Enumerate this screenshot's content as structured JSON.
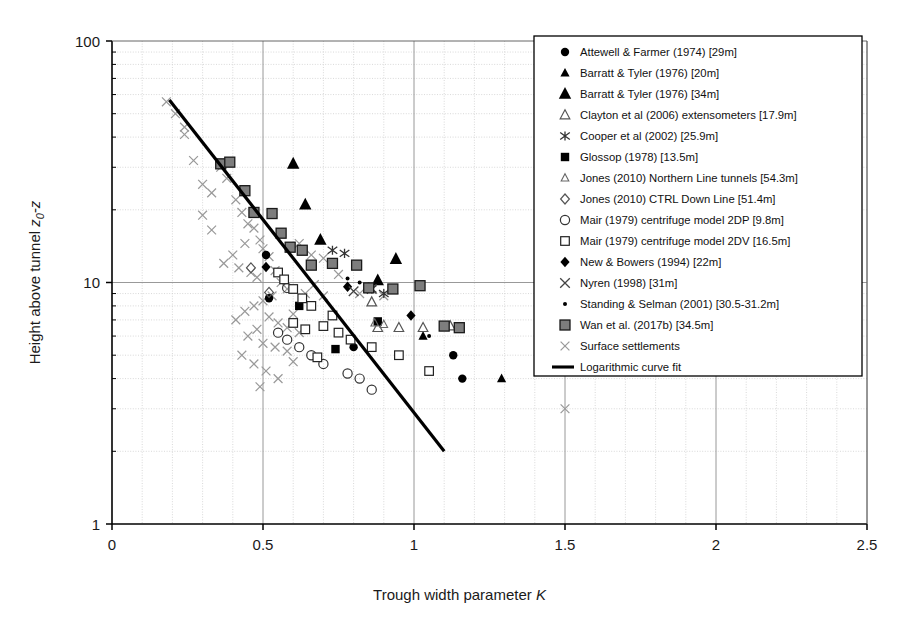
{
  "chart_data": {
    "type": "scatter",
    "title": "",
    "xlabel": "Trough width parameter K",
    "ylabel": "Height above tunnel z0-z",
    "ylabel_parts": {
      "main": "Height above tunnel ",
      "z": "z",
      "sub": "0",
      "tail": "-z"
    },
    "xlabel_parts": {
      "main": "Trough  width  parameter ",
      "italic": "K"
    },
    "xlim": [
      0,
      2.5
    ],
    "ylim": [
      1,
      100
    ],
    "yscale": "log",
    "xscale": "linear",
    "grid": true,
    "minor_grid": true,
    "xticks": [
      "0",
      "0.5",
      "1",
      "1.5",
      "2",
      "2.5"
    ],
    "xtick_values": [
      0,
      0.5,
      1,
      1.5,
      2,
      2.5
    ],
    "yticks": [
      "1",
      "10",
      "100"
    ],
    "ytick_values": [
      1,
      10,
      100
    ],
    "legend_position": "upper-right",
    "series": [
      {
        "name": "Attewell & Farmer (1974) [29m]",
        "marker": "filled-circle",
        "color": "#000000",
        "points": [
          [
            0.51,
            13.0
          ],
          [
            0.52,
            8.6
          ],
          [
            0.8,
            5.4
          ],
          [
            1.13,
            5.0
          ],
          [
            1.16,
            4.0
          ]
        ]
      },
      {
        "name": "Barratt & Tyler (1976) [20m]",
        "marker": "filled-triangle",
        "color": "#000000",
        "points": [
          [
            1.03,
            6.0
          ],
          [
            1.29,
            4.0
          ]
        ]
      },
      {
        "name": "Barratt & Tyler (1976) [34m]",
        "marker": "filled-triangle-large",
        "color": "#000000",
        "points": [
          [
            0.6,
            31.0
          ],
          [
            0.64,
            21.0
          ],
          [
            0.69,
            15.0
          ],
          [
            0.88,
            10.2
          ],
          [
            0.94,
            12.5
          ]
        ]
      },
      {
        "name": "Clayton et al (2006) extensometers [17.9m]",
        "marker": "open-triangle",
        "color": "#555555",
        "points": [
          [
            0.88,
            6.5
          ],
          [
            0.95,
            6.5
          ],
          [
            1.03,
            6.5
          ],
          [
            1.12,
            6.6
          ],
          [
            0.86,
            8.3
          ]
        ]
      },
      {
        "name": "Cooper et al (2002) [25.9m]",
        "marker": "asterisk",
        "color": "#333333",
        "points": [
          [
            0.73,
            13.6
          ],
          [
            0.77,
            13.2
          ],
          [
            0.86,
            9.4
          ],
          [
            0.9,
            9.0
          ]
        ]
      },
      {
        "name": "Glossop (1978) [13.5m]",
        "marker": "filled-square",
        "color": "#000000",
        "points": [
          [
            0.62,
            8.0
          ],
          [
            0.88,
            6.9
          ],
          [
            0.74,
            5.3
          ]
        ]
      },
      {
        "name": "Jones (2010) Northern Line tunnels [54.3m]",
        "marker": "open-triangle-small",
        "color": "#666666",
        "points": [
          [
            0.87,
            6.8
          ],
          [
            0.9,
            6.7
          ]
        ]
      },
      {
        "name": "Jones (2010) CTRL Down Line [51.4m]",
        "marker": "open-diamond",
        "color": "#555555",
        "points": [
          [
            0.46,
            11.5
          ],
          [
            0.52,
            9.1
          ]
        ]
      },
      {
        "name": "Mair (1979) centrifuge model 2DP [9.8m]",
        "marker": "open-circle",
        "color": "#333333",
        "points": [
          [
            0.58,
            9.5
          ],
          [
            0.55,
            6.2
          ],
          [
            0.58,
            5.8
          ],
          [
            0.62,
            5.4
          ],
          [
            0.66,
            5.0
          ],
          [
            0.7,
            4.6
          ],
          [
            0.78,
            4.2
          ],
          [
            0.82,
            4.0
          ],
          [
            0.86,
            3.6
          ]
        ]
      },
      {
        "name": "Mair (1979) centrifuge model 2DV [16.5m]",
        "marker": "open-square",
        "color": "#222222",
        "points": [
          [
            0.55,
            11.0
          ],
          [
            0.57,
            10.3
          ],
          [
            0.6,
            9.4
          ],
          [
            0.63,
            8.6
          ],
          [
            0.66,
            8.0
          ],
          [
            0.6,
            6.8
          ],
          [
            0.64,
            6.4
          ],
          [
            0.7,
            6.6
          ],
          [
            0.75,
            6.2
          ],
          [
            0.79,
            5.8
          ],
          [
            0.86,
            5.4
          ],
          [
            0.73,
            7.3
          ],
          [
            0.95,
            5.0
          ],
          [
            1.05,
            4.3
          ],
          [
            0.68,
            4.9
          ]
        ]
      },
      {
        "name": "New & Bowers (1994) [22m]",
        "marker": "filled-diamond",
        "color": "#000000",
        "points": [
          [
            0.51,
            11.6
          ],
          [
            0.78,
            9.6
          ],
          [
            0.99,
            7.3
          ]
        ]
      },
      {
        "name": "Nyren (1998) [31m]",
        "marker": "cross-x",
        "color": "#444444",
        "points": [
          [
            0.8,
            9.2
          ],
          [
            0.86,
            9.4
          ]
        ]
      },
      {
        "name": "Standing & Selman (2001) [30.5-31.2m]",
        "marker": "small-dot",
        "color": "#000000",
        "points": [
          [
            0.78,
            10.4
          ],
          [
            0.82,
            10.0
          ],
          [
            0.85,
            9.8
          ],
          [
            1.05,
            6.0
          ]
        ]
      },
      {
        "name": "Wan et al. (2017b) [34.5m]",
        "marker": "shaded-square",
        "color": "#6e6e6e",
        "points": [
          [
            0.36,
            31.0
          ],
          [
            0.39,
            31.5
          ],
          [
            0.44,
            24.0
          ],
          [
            0.47,
            19.5
          ],
          [
            0.53,
            19.3
          ],
          [
            0.56,
            16.0
          ],
          [
            0.59,
            14.0
          ],
          [
            0.63,
            13.6
          ],
          [
            0.66,
            11.8
          ],
          [
            0.73,
            12.0
          ],
          [
            0.81,
            11.8
          ],
          [
            0.85,
            9.5
          ],
          [
            0.93,
            9.4
          ],
          [
            1.02,
            9.7
          ],
          [
            1.1,
            6.6
          ],
          [
            1.15,
            6.5
          ]
        ]
      },
      {
        "name": "Surface settlements",
        "marker": "light-x",
        "color": "#9a9a9a",
        "points": [
          [
            0.18,
            56.0
          ],
          [
            0.24,
            41.0
          ],
          [
            0.27,
            32.0
          ],
          [
            0.3,
            25.5
          ],
          [
            0.33,
            23.5
          ],
          [
            0.36,
            30.0
          ],
          [
            0.38,
            27.0
          ],
          [
            0.41,
            22.0
          ],
          [
            0.43,
            19.5
          ],
          [
            0.45,
            17.5
          ],
          [
            0.47,
            16.8
          ],
          [
            0.49,
            15.0
          ],
          [
            0.44,
            14.5
          ],
          [
            0.4,
            13.0
          ],
          [
            0.37,
            12.0
          ],
          [
            0.42,
            11.5
          ],
          [
            0.46,
            11.0
          ],
          [
            0.48,
            10.5
          ],
          [
            0.5,
            13.8
          ],
          [
            0.52,
            12.8
          ],
          [
            0.54,
            11.2
          ],
          [
            0.56,
            10.0
          ],
          [
            0.58,
            9.4
          ],
          [
            0.53,
            8.8
          ],
          [
            0.5,
            8.4
          ],
          [
            0.47,
            8.0
          ],
          [
            0.44,
            7.6
          ],
          [
            0.41,
            7.0
          ],
          [
            0.52,
            7.2
          ],
          [
            0.55,
            6.8
          ],
          [
            0.58,
            6.5
          ],
          [
            0.62,
            6.2
          ],
          [
            0.6,
            7.4
          ],
          [
            0.64,
            9.0
          ],
          [
            0.48,
            6.4
          ],
          [
            0.45,
            6.0
          ],
          [
            0.5,
            5.6
          ],
          [
            0.54,
            5.4
          ],
          [
            0.58,
            5.2
          ],
          [
            0.43,
            5.0
          ],
          [
            0.47,
            4.6
          ],
          [
            0.51,
            4.3
          ],
          [
            0.55,
            4.0
          ],
          [
            0.6,
            4.7
          ],
          [
            0.49,
            3.7
          ],
          [
            0.62,
            14.5
          ],
          [
            0.66,
            13.0
          ],
          [
            0.7,
            12.6
          ],
          [
            0.75,
            10.8
          ],
          [
            0.82,
            9.0
          ],
          [
            0.9,
            8.8
          ],
          [
            0.33,
            16.5
          ],
          [
            0.3,
            19.0
          ],
          [
            0.24,
            44.0
          ],
          [
            0.21,
            50.0
          ],
          [
            1.5,
            3.0
          ],
          [
            0.67,
            9.8
          ],
          [
            0.7,
            8.8
          ]
        ]
      }
    ],
    "fit": {
      "name": "Logarithmic curve fit",
      "type": "line",
      "color": "#000000",
      "width": 3.2,
      "points": [
        [
          0.19,
          57.0
        ],
        [
          1.1,
          2.0
        ]
      ]
    }
  },
  "legend": {
    "items": [
      {
        "marker": "filled-circle",
        "label": "Attewell & Farmer (1974) [29m]"
      },
      {
        "marker": "filled-triangle",
        "label": "Barratt & Tyler (1976) [20m]"
      },
      {
        "marker": "filled-triangle-large",
        "label": "Barratt & Tyler (1976) [34m]"
      },
      {
        "marker": "open-triangle",
        "label": "Clayton et al (2006) extensometers [17.9m]"
      },
      {
        "marker": "asterisk",
        "label": "Cooper et al (2002) [25.9m]"
      },
      {
        "marker": "filled-square",
        "label": "Glossop (1978) [13.5m]"
      },
      {
        "marker": "open-triangle-small",
        "label": "Jones (2010) Northern Line tunnels [54.3m]"
      },
      {
        "marker": "open-diamond",
        "label": "Jones (2010) CTRL Down Line [51.4m]"
      },
      {
        "marker": "open-circle",
        "label": "Mair (1979) centrifuge model 2DP [9.8m]"
      },
      {
        "marker": "open-square",
        "label": "Mair (1979) centrifuge model 2DV [16.5m]"
      },
      {
        "marker": "filled-diamond",
        "label": "New & Bowers (1994) [22m]"
      },
      {
        "marker": "cross-x",
        "label": "Nyren (1998) [31m]"
      },
      {
        "marker": "small-dot",
        "label": "Standing & Selman (2001) [30.5-31.2m]"
      },
      {
        "marker": "shaded-square",
        "label": "Wan et al. (2017b) [34.5m]"
      },
      {
        "marker": "light-x",
        "label": "Surface settlements"
      },
      {
        "marker": "line",
        "label": "Logarithmic curve fit"
      }
    ]
  }
}
